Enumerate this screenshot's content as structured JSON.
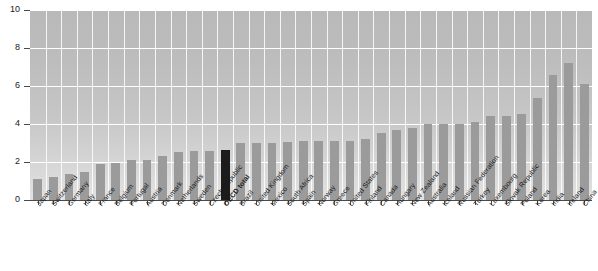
{
  "chart_data": {
    "type": "bar",
    "title": "",
    "xlabel": "",
    "ylabel": "",
    "ylim": [
      0,
      10
    ],
    "yticks": [
      0,
      2,
      4,
      6,
      8,
      10
    ],
    "grid": true,
    "legend": false,
    "highlight_category": "OECD total",
    "colors": {
      "bar": "#9b9b9b",
      "highlight_bar": "#1c1c1c",
      "plot_background": "#c4c4c4",
      "gridline": "#ffffff",
      "axis": "#4a4a4a",
      "text": "#1a1a1a"
    },
    "categories": [
      "Japan",
      "Switzerland",
      "Germany",
      "Italy",
      "France",
      "Belgium",
      "Portugal",
      "Austria",
      "Denmark",
      "Netherlands",
      "Sweden",
      "Czech Republic",
      "OECD total",
      "Brazil",
      "United Kingdom",
      "Mexico",
      "South Africa",
      "Spain",
      "Norway",
      "Greece",
      "United States",
      "Finland",
      "Canada",
      "Hungary",
      "New Zealand",
      "Australia",
      "Iceland",
      "Russian Federation",
      "Turkey",
      "Luxembourg",
      "Slovak Republic",
      "Poland",
      "Korea",
      "India",
      "Ireland",
      "China"
    ],
    "values": [
      1.1,
      1.2,
      1.35,
      1.5,
      1.9,
      1.95,
      2.1,
      2.1,
      2.3,
      2.55,
      2.6,
      2.6,
      2.65,
      3.0,
      3.0,
      3.0,
      3.05,
      3.1,
      3.1,
      3.1,
      3.1,
      3.2,
      3.55,
      3.7,
      3.8,
      4.0,
      4.0,
      4.0,
      4.1,
      4.4,
      4.4,
      4.55,
      5.35,
      6.6,
      7.2,
      6.1
    ]
  }
}
